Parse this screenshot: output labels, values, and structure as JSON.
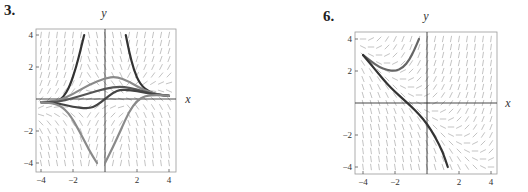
{
  "figures": [
    {
      "label": "3.",
      "x_axis_label": "x",
      "y_axis_label": "y",
      "x_ticks": [
        "−4",
        "−2",
        "2",
        "4"
      ],
      "y_ticks": [
        "4",
        "2",
        "−2",
        "−4"
      ],
      "slope_field": "y' = x*y*(... )-type field (shown as short line segments)",
      "curve_color_dark": "#3a3a3a",
      "curve_color_gray": "#7a7a7a"
    },
    {
      "label": "6.",
      "x_axis_label": "x",
      "y_axis_label": "y",
      "x_ticks": [
        "−4",
        "−2",
        "2",
        "4"
      ],
      "y_ticks": [
        "4",
        "2",
        "−2",
        "−4"
      ],
      "curve_color_dark": "#3a3a3a",
      "curve_color_gray": "#6a6a6a"
    }
  ],
  "chart_data": [
    {
      "type": "line",
      "title": "3.",
      "xlabel": "x",
      "ylabel": "y",
      "xlim": [
        -4.3,
        4.3
      ],
      "ylim": [
        -4.3,
        4.3
      ],
      "x_ticks": [
        -4,
        -2,
        2,
        4
      ],
      "y_ticks": [
        -4,
        -2,
        2,
        4
      ],
      "grid": false,
      "series": [
        {
          "name": "solution-dark-left",
          "points": [
            [
              -4,
              -0.2
            ],
            [
              -3,
              -0.15
            ],
            [
              -2.6,
              0.1
            ],
            [
              -2.2,
              0.8
            ],
            [
              -1.8,
              2.0
            ],
            [
              -1.5,
              3.2
            ],
            [
              -1.3,
              4
            ]
          ]
        },
        {
          "name": "solution-dark-right",
          "points": [
            [
              1.3,
              4
            ],
            [
              1.5,
              3.0
            ],
            [
              1.8,
              1.8
            ],
            [
              2.2,
              0.9
            ],
            [
              2.8,
              0.4
            ],
            [
              3.5,
              0.25
            ],
            [
              4,
              0.2
            ]
          ]
        },
        {
          "name": "solution-gray-upper",
          "points": [
            [
              -4,
              -0.2
            ],
            [
              -3,
              -0.15
            ],
            [
              -2,
              0.3
            ],
            [
              -1,
              0.9
            ],
            [
              0,
              1.3
            ],
            [
              0.7,
              1.4
            ],
            [
              1.5,
              1.1
            ],
            [
              2.5,
              0.5
            ],
            [
              3.5,
              0.25
            ],
            [
              4,
              0.2
            ]
          ]
        },
        {
          "name": "solution-dark-middle-upper",
          "points": [
            [
              -4,
              -0.2
            ],
            [
              -3,
              -0.2
            ],
            [
              -2,
              0.05
            ],
            [
              -1,
              0.35
            ],
            [
              0,
              0.65
            ],
            [
              1,
              0.8
            ],
            [
              2,
              0.6
            ],
            [
              3,
              0.3
            ],
            [
              4,
              0.2
            ]
          ]
        },
        {
          "name": "solution-dark-through-origin",
          "points": [
            [
              -4,
              -0.2
            ],
            [
              -3,
              -0.25
            ],
            [
              -2,
              -0.5
            ],
            [
              -1,
              -0.6
            ],
            [
              -0.5,
              -0.4
            ],
            [
              0,
              0
            ],
            [
              0.5,
              0.4
            ],
            [
              1,
              0.6
            ],
            [
              2,
              0.5
            ],
            [
              3,
              0.3
            ],
            [
              4,
              0.2
            ]
          ]
        },
        {
          "name": "solution-gray-lower-left",
          "points": [
            [
              -4,
              -0.2
            ],
            [
              -3,
              -0.3
            ],
            [
              -2.3,
              -0.8
            ],
            [
              -1.6,
              -2.0
            ],
            [
              -1,
              -3.2
            ],
            [
              -0.5,
              -4
            ]
          ]
        },
        {
          "name": "solution-gray-lower-right",
          "points": [
            [
              0,
              -4
            ],
            [
              0.5,
              -3.0
            ],
            [
              1,
              -1.9
            ],
            [
              1.5,
              -0.8
            ],
            [
              2,
              -0.1
            ],
            [
              2.5,
              0.2
            ],
            [
              3.2,
              0.25
            ],
            [
              4,
              0.2
            ]
          ]
        }
      ]
    },
    {
      "type": "line",
      "title": "6.",
      "xlabel": "x",
      "ylabel": "y",
      "xlim": [
        -4.3,
        4.3
      ],
      "ylim": [
        -4.3,
        4.3
      ],
      "x_ticks": [
        -4,
        -2,
        2,
        4
      ],
      "y_ticks": [
        -4,
        -2,
        2,
        4
      ],
      "grid": false,
      "series": [
        {
          "name": "solution-upper",
          "points": [
            [
              -4,
              3.0
            ],
            [
              -3.5,
              2.6
            ],
            [
              -3,
              2.25
            ],
            [
              -2.5,
              2.05
            ],
            [
              -2,
              2.0
            ],
            [
              -1.5,
              2.2
            ],
            [
              -1.1,
              2.7
            ],
            [
              -0.8,
              3.3
            ],
            [
              -0.5,
              4.0
            ]
          ]
        },
        {
          "name": "solution-lower",
          "points": [
            [
              -4,
              3.0
            ],
            [
              -3.5,
              2.4
            ],
            [
              -3,
              1.8
            ],
            [
              -2.5,
              1.2
            ],
            [
              -2,
              0.7
            ],
            [
              -1.5,
              0.25
            ],
            [
              -1,
              -0.2
            ],
            [
              -0.5,
              -0.7
            ],
            [
              0,
              -1.3
            ],
            [
              0.5,
              -2.1
            ],
            [
              1,
              -3.1
            ],
            [
              1.3,
              -4.0
            ]
          ]
        }
      ]
    }
  ]
}
